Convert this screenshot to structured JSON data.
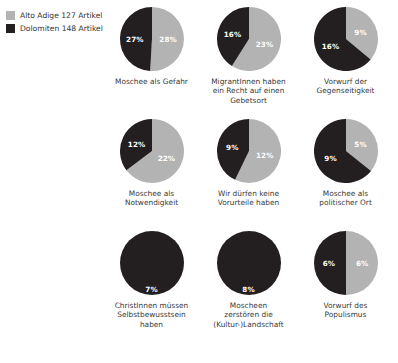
{
  "legend": {
    "items": [
      {
        "label": "Alto Adige 127 Artikel",
        "color": "#b3b3b3",
        "swatch_name": "alto-adige"
      },
      {
        "label": "Dolomiten 148 Artikel",
        "color": "#231f20",
        "swatch_name": "dolomiten"
      }
    ]
  },
  "chart_data": {
    "type": "pie",
    "title": "",
    "legend_position": "top-left",
    "series": [
      {
        "name": "Alto Adige 127 Artikel",
        "color": "#b3b3b3"
      },
      {
        "name": "Dolomiten 148 Artikel",
        "color": "#231f20"
      }
    ],
    "categories": [
      "Moschee als Gefahr",
      "MigrantInnen haben ein Recht auf einen Gebetsort",
      "Vorwurf der Gegenseitigkeit",
      "Moschee als Notwendigkeit",
      "Wir dürfen keine Vorurteile haben",
      "Moschee als politischer Ort",
      "ChristInnen müssen Selbstbewusstsein haben",
      "Moscheen zerstören die (Kultur-)Landschaft",
      "Vorwurf des Populismus"
    ],
    "values": {
      "Alto Adige 127 Artikel": [
        28,
        23,
        9,
        22,
        12,
        5,
        0,
        0,
        6
      ],
      "Dolomiten 148 Artikel": [
        27,
        16,
        16,
        12,
        9,
        9,
        7,
        8,
        6
      ]
    },
    "unit": "%"
  },
  "pies": [
    {
      "caption": [
        "Moschee als Gefahr"
      ],
      "dark_pct": "27%",
      "light_pct": "28%",
      "dark_value": 27,
      "light_value": 28
    },
    {
      "caption": [
        "MigrantInnen haben",
        "ein Recht auf einen",
        "Gebetsort"
      ],
      "dark_pct": "16%",
      "light_pct": "23%",
      "dark_value": 16,
      "light_value": 23
    },
    {
      "caption": [
        "Vorwurf der",
        "Gegenseitigkeit"
      ],
      "dark_pct": "16%",
      "light_pct": "9%",
      "dark_value": 16,
      "light_value": 9
    },
    {
      "caption": [
        "Moschee als",
        "Notwendigkeit"
      ],
      "dark_pct": "12%",
      "light_pct": "22%",
      "dark_value": 12,
      "light_value": 22
    },
    {
      "caption": [
        "Wir dürfen keine",
        "Vorurteile haben"
      ],
      "dark_pct": "9%",
      "light_pct": "12%",
      "dark_value": 9,
      "light_value": 12
    },
    {
      "caption": [
        "Moschee als",
        "politischer Ort"
      ],
      "dark_pct": "9%",
      "light_pct": "5%",
      "dark_value": 9,
      "light_value": 5
    },
    {
      "caption": [
        "ChristInnen müssen",
        "Selbstbewusstsein",
        "haben"
      ],
      "dark_pct": "7%",
      "light_pct": "",
      "dark_value": 7,
      "light_value": 0
    },
    {
      "caption": [
        "Moscheen",
        "zerstören die",
        "(Kultur-)Landschaft"
      ],
      "dark_pct": "8%",
      "light_pct": "",
      "dark_value": 8,
      "light_value": 0
    },
    {
      "caption": [
        "Vorwurf des",
        "Populismus"
      ],
      "dark_pct": "6%",
      "light_pct": "6%",
      "dark_value": 6,
      "light_value": 6
    }
  ]
}
